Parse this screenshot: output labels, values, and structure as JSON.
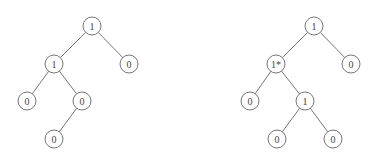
{
  "diagram": {
    "type": "binary-trees",
    "style": {
      "line_color": "#666666",
      "text_color": "#444444",
      "node_radius": 9
    },
    "trees": [
      {
        "name": "left-tree",
        "nodes": [
          {
            "id": "a",
            "label": "1",
            "x": 92,
            "y": 26
          },
          {
            "id": "b",
            "label": "1",
            "x": 54,
            "y": 64
          },
          {
            "id": "c",
            "label": "0",
            "x": 129,
            "y": 64
          },
          {
            "id": "d",
            "label": "0",
            "x": 27,
            "y": 101
          },
          {
            "id": "e",
            "label": "0",
            "x": 82,
            "y": 101
          },
          {
            "id": "f",
            "label": "0",
            "x": 54,
            "y": 139
          }
        ],
        "edges": [
          [
            "a",
            "b"
          ],
          [
            "a",
            "c"
          ],
          [
            "b",
            "d"
          ],
          [
            "b",
            "e"
          ],
          [
            "e",
            "f"
          ]
        ]
      },
      {
        "name": "right-tree",
        "nodes": [
          {
            "id": "a",
            "label": "1",
            "x": 314,
            "y": 26
          },
          {
            "id": "b",
            "label": "1*",
            "x": 276,
            "y": 64
          },
          {
            "id": "c",
            "label": "0",
            "x": 351,
            "y": 64
          },
          {
            "id": "d",
            "label": "0",
            "x": 250,
            "y": 101
          },
          {
            "id": "e",
            "label": "1",
            "x": 305,
            "y": 101
          },
          {
            "id": "f",
            "label": "0",
            "x": 277,
            "y": 139
          },
          {
            "id": "g",
            "label": "0",
            "x": 333,
            "y": 139
          }
        ],
        "edges": [
          [
            "a",
            "b"
          ],
          [
            "a",
            "c"
          ],
          [
            "b",
            "d"
          ],
          [
            "b",
            "e"
          ],
          [
            "e",
            "f"
          ],
          [
            "e",
            "g"
          ]
        ]
      }
    ]
  }
}
